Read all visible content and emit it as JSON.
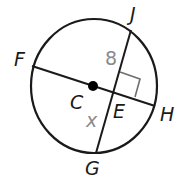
{
  "diagram": {
    "type": "circle-chords",
    "circle": {
      "center_label": "C"
    },
    "points": {
      "F": "F",
      "J": "J",
      "H": "H",
      "G": "G",
      "C": "C",
      "E": "E"
    },
    "segments": [
      {
        "name": "FH",
        "from": "F",
        "to": "H",
        "passes_through": [
          "C",
          "E"
        ]
      },
      {
        "name": "JG",
        "from": "J",
        "to": "G",
        "passes_through": [
          "E"
        ]
      }
    ],
    "measures": {
      "JE": "8",
      "EG": "x"
    },
    "right_angle_at": "E",
    "colors": {
      "stroke": "#1a1a1a",
      "measure_text": "#8a8a8a",
      "right_angle_marker": "#6e6e6e"
    }
  }
}
